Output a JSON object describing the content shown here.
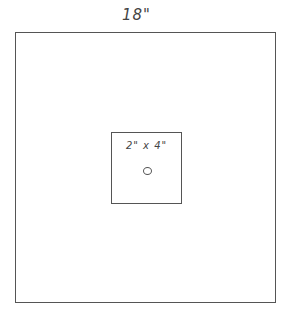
{
  "diagram": {
    "outer": {
      "label": "18\"",
      "shape": "square"
    },
    "inner": {
      "label": "2\" x 4\"",
      "shape": "rectangle",
      "feature": "hole-circle"
    },
    "line_color": "#555555"
  }
}
